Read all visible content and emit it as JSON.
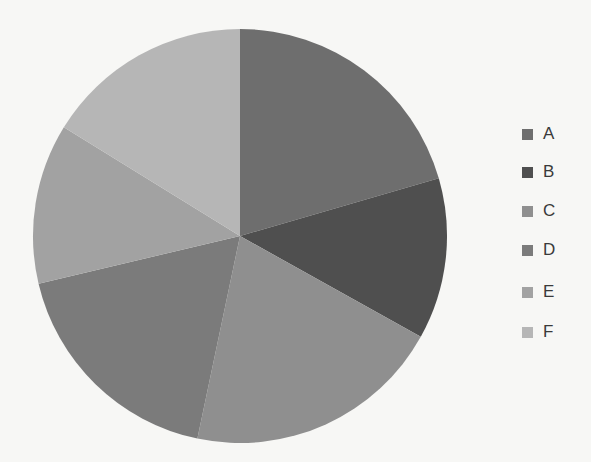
{
  "chart_data": {
    "type": "pie",
    "title": "",
    "categories": [
      "A",
      "B",
      "C",
      "D",
      "E",
      "F"
    ],
    "values": [
      20.5,
      12.6,
      20.2,
      18.0,
      12.5,
      16.2
    ],
    "unit": "percent (estimated from slice angles)",
    "colors": [
      "#6e6e6e",
      "#4f4f4f",
      "#8f8f8f",
      "#7b7b7b",
      "#a2a2a2",
      "#b6b6b6"
    ],
    "start_angle_deg": 0,
    "direction": "clockwise",
    "legend_position": "right",
    "center": [
      240,
      236
    ],
    "radius": 207
  },
  "legend": {
    "items": [
      {
        "label": "A",
        "color": "#6e6e6e"
      },
      {
        "label": "B",
        "color": "#4f4f4f"
      },
      {
        "label": "C",
        "color": "#8f8f8f"
      },
      {
        "label": "D",
        "color": "#7b7b7b"
      },
      {
        "label": "E",
        "color": "#a2a2a2"
      },
      {
        "label": "F",
        "color": "#b6b6b6"
      }
    ]
  }
}
